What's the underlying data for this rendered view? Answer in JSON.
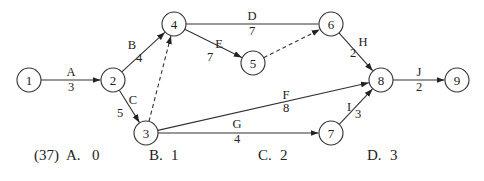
{
  "diagram": {
    "type": "activity-on-arrow network",
    "nodes": [
      {
        "id": "1",
        "x": 29,
        "y": 80
      },
      {
        "id": "2",
        "x": 113,
        "y": 80
      },
      {
        "id": "3",
        "x": 146,
        "y": 133
      },
      {
        "id": "4",
        "x": 174,
        "y": 24
      },
      {
        "id": "5",
        "x": 253,
        "y": 63
      },
      {
        "id": "6",
        "x": 331,
        "y": 24
      },
      {
        "id": "7",
        "x": 331,
        "y": 133
      },
      {
        "id": "8",
        "x": 381,
        "y": 80
      },
      {
        "id": "9",
        "x": 457,
        "y": 80
      }
    ],
    "edges": [
      {
        "from": "1",
        "to": "2",
        "activity": "A",
        "duration": "3",
        "dashed": false
      },
      {
        "from": "2",
        "to": "4",
        "activity": "B",
        "duration": "4",
        "dashed": false
      },
      {
        "from": "2",
        "to": "3",
        "activity": "C",
        "duration": "5",
        "dashed": false
      },
      {
        "from": "4",
        "to": "6",
        "activity": "D",
        "duration": "7",
        "dashed": false
      },
      {
        "from": "4",
        "to": "5",
        "activity": "E",
        "duration": "7",
        "dashed": false
      },
      {
        "from": "3",
        "to": "8",
        "activity": "F",
        "duration": "8",
        "dashed": false
      },
      {
        "from": "3",
        "to": "7",
        "activity": "G",
        "duration": "4",
        "dashed": false
      },
      {
        "from": "6",
        "to": "8",
        "activity": "H",
        "duration": "2",
        "dashed": false
      },
      {
        "from": "7",
        "to": "8",
        "activity": "I",
        "duration": "3",
        "dashed": false
      },
      {
        "from": "8",
        "to": "9",
        "activity": "J",
        "duration": "2",
        "dashed": false
      },
      {
        "from": "3",
        "to": "4",
        "activity": "",
        "duration": "",
        "dashed": true
      },
      {
        "from": "5",
        "to": "6",
        "activity": "",
        "duration": "",
        "dashed": true
      }
    ],
    "labels": {
      "A": {
        "text": "A",
        "x": 71,
        "y": 76
      },
      "A_d": {
        "text": "3",
        "x": 71,
        "y": 91
      },
      "B": {
        "text": "B",
        "x": 132,
        "y": 49
      },
      "B_d": {
        "text": "4",
        "x": 139,
        "y": 62
      },
      "C": {
        "text": "C",
        "x": 133,
        "y": 104
      },
      "C_d": {
        "text": "5",
        "x": 120,
        "y": 117
      },
      "D": {
        "text": "D",
        "x": 252,
        "y": 20
      },
      "D_d": {
        "text": "7",
        "x": 252,
        "y": 35
      },
      "E": {
        "text": "E",
        "x": 219,
        "y": 48
      },
      "E_d": {
        "text": "7",
        "x": 210,
        "y": 61
      },
      "F": {
        "text": "F",
        "x": 286,
        "y": 99
      },
      "F_d": {
        "text": "8",
        "x": 286,
        "y": 112
      },
      "G": {
        "text": "G",
        "x": 237,
        "y": 128
      },
      "G_d": {
        "text": "4",
        "x": 237,
        "y": 143
      },
      "H": {
        "text": "H",
        "x": 363,
        "y": 46
      },
      "H_d": {
        "text": "2",
        "x": 353,
        "y": 57
      },
      "I": {
        "text": "I",
        "x": 349,
        "y": 111
      },
      "I_d": {
        "text": "3",
        "x": 358,
        "y": 118
      },
      "J": {
        "text": "J",
        "x": 419,
        "y": 76
      },
      "J_d": {
        "text": "2",
        "x": 419,
        "y": 91
      }
    }
  },
  "question": {
    "number": "(37)",
    "options": [
      {
        "letter": "A.",
        "value": "0"
      },
      {
        "letter": "B.",
        "value": "1"
      },
      {
        "letter": "C.",
        "value": "2"
      },
      {
        "letter": "D.",
        "value": "3"
      }
    ]
  }
}
